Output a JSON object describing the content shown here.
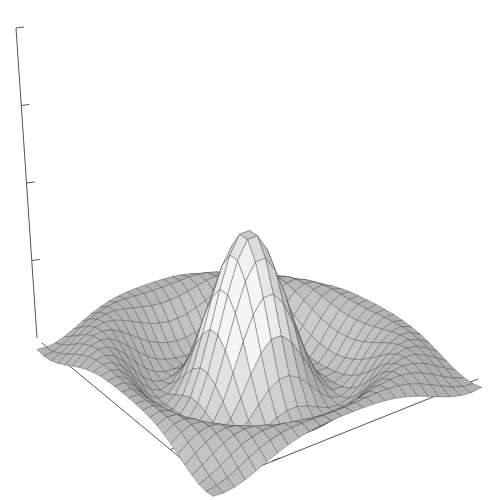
{
  "chart_data": {
    "type": "surface3d",
    "title": "",
    "xlabel": "",
    "ylabel": "",
    "zlabel": "",
    "function": "z = sin(r)/r, r = sqrt(x^2 + y^2)",
    "x_range": [
      -8,
      8
    ],
    "y_range": [
      -8,
      8
    ],
    "z_range": [
      -0.2,
      1.0
    ],
    "grid_size": 25,
    "z_ticks": 4,
    "x_ticks": 2,
    "y_ticks": 2,
    "tick_labels_visible": false,
    "colormap": "grayscale",
    "peak_value": 1.0,
    "projection": {
      "corner_left": [
        37,
        338
      ],
      "corner_front": [
        213,
        485
      ],
      "corner_right": [
        482,
        376
      ],
      "corner_back": [
        262,
        262
      ],
      "z_axis_top": [
        16,
        28
      ],
      "z_pixels_per_unit": 245
    },
    "colors": {
      "axis": "#555555",
      "mesh_line": "#3a3a3a",
      "face_light": "#f4f4f4",
      "face_dark": "#5a5a5a",
      "background": "#ffffff"
    }
  }
}
